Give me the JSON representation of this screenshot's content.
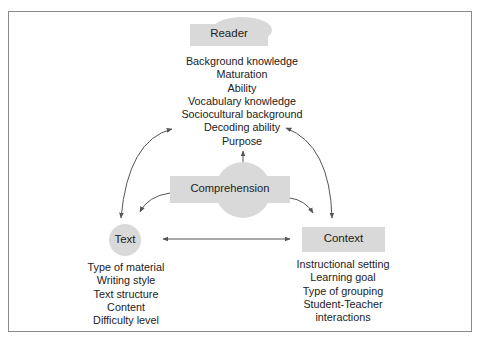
{
  "diagram": {
    "colors": {
      "node_fill": "#d9d9d9",
      "arrow": "#555555",
      "frame": "#8a8a8a",
      "text": "#222222"
    },
    "nodes": {
      "reader": {
        "label": "Reader",
        "shape": "rectangle-with-dome",
        "attributes": [
          "Background knowledge",
          "Maturation",
          "Ability",
          "Vocabulary knowledge",
          "Sociocultural background",
          "Decoding ability",
          "Purpose"
        ]
      },
      "comprehension": {
        "label": "Comprehension",
        "shape": "rectangle-with-circle"
      },
      "text": {
        "label": "Text",
        "shape": "circle",
        "attributes": [
          "Type of material",
          "Writing style",
          "Text structure",
          "Content",
          "Difficulty level"
        ]
      },
      "context": {
        "label": "Context",
        "shape": "rectangle",
        "attributes": [
          "Instructional setting",
          "Learning goal",
          "Type of grouping",
          "Student-Teacher",
          "interactions"
        ]
      }
    },
    "edges": [
      {
        "from": "comprehension",
        "to": "reader",
        "direction": "one-way"
      },
      {
        "from": "comprehension",
        "to": "text",
        "direction": "one-way"
      },
      {
        "from": "comprehension",
        "to": "context",
        "direction": "one-way"
      },
      {
        "from": "reader",
        "to": "text",
        "direction": "two-way"
      },
      {
        "from": "reader",
        "to": "context",
        "direction": "two-way"
      },
      {
        "from": "text",
        "to": "context",
        "direction": "two-way"
      }
    ]
  }
}
